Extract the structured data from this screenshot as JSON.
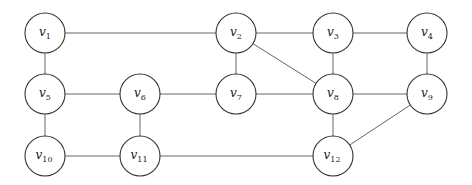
{
  "diagram": {
    "type": "undirected-graph",
    "node_radius": 20,
    "colors": {
      "edge": "#555555",
      "node_stroke": "#333333",
      "node_fill": "#ffffff",
      "label": "#222222"
    },
    "nodes": [
      {
        "id": "v1",
        "base": "v",
        "sub": "1",
        "x": 45,
        "y": 33
      },
      {
        "id": "v2",
        "base": "v",
        "sub": "2",
        "x": 236,
        "y": 33
      },
      {
        "id": "v3",
        "base": "v",
        "sub": "3",
        "x": 333,
        "y": 33
      },
      {
        "id": "v4",
        "base": "v",
        "sub": "4",
        "x": 427,
        "y": 33
      },
      {
        "id": "v5",
        "base": "v",
        "sub": "5",
        "x": 45,
        "y": 94
      },
      {
        "id": "v6",
        "base": "v",
        "sub": "6",
        "x": 140,
        "y": 94
      },
      {
        "id": "v7",
        "base": "v",
        "sub": "7",
        "x": 236,
        "y": 94
      },
      {
        "id": "v8",
        "base": "v",
        "sub": "8",
        "x": 333,
        "y": 94
      },
      {
        "id": "v9",
        "base": "v",
        "sub": "9",
        "x": 427,
        "y": 94
      },
      {
        "id": "v10",
        "base": "v",
        "sub": "10",
        "x": 45,
        "y": 156
      },
      {
        "id": "v11",
        "base": "v",
        "sub": "11",
        "x": 140,
        "y": 156
      },
      {
        "id": "v12",
        "base": "v",
        "sub": "12",
        "x": 333,
        "y": 156
      }
    ],
    "edges": [
      [
        "v1",
        "v2"
      ],
      [
        "v2",
        "v3"
      ],
      [
        "v3",
        "v4"
      ],
      [
        "v1",
        "v5"
      ],
      [
        "v2",
        "v7"
      ],
      [
        "v2",
        "v8"
      ],
      [
        "v3",
        "v8"
      ],
      [
        "v4",
        "v9"
      ],
      [
        "v5",
        "v6"
      ],
      [
        "v6",
        "v7"
      ],
      [
        "v7",
        "v8"
      ],
      [
        "v8",
        "v9"
      ],
      [
        "v5",
        "v10"
      ],
      [
        "v6",
        "v11"
      ],
      [
        "v8",
        "v12"
      ],
      [
        "v9",
        "v12"
      ],
      [
        "v10",
        "v11"
      ],
      [
        "v11",
        "v12"
      ]
    ]
  }
}
